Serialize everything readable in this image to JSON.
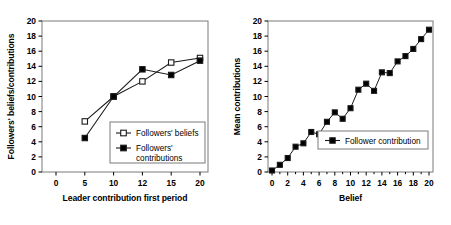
{
  "figure": {
    "background": "#ffffff",
    "line_color": "#1a1a1a",
    "marker_fill_open": "#ffffff",
    "marker_fill_filled": "#000000"
  },
  "chart_data": [
    {
      "type": "line",
      "panel": "left",
      "title": "",
      "xlabel": "Leader contribution first period",
      "ylabel": "Followers' beliefs/contributions",
      "xtick_labels": [
        "0",
        "5",
        "10",
        "12",
        "15",
        "20"
      ],
      "categories": [
        0,
        5,
        10,
        12,
        15,
        20
      ],
      "ytick_labels": [
        "0",
        "2",
        "4",
        "6",
        "8",
        "10",
        "12",
        "14",
        "16",
        "18",
        "20"
      ],
      "ylim": [
        0,
        20
      ],
      "grid": false,
      "legend_position": "lower-right-inside",
      "series": [
        {
          "name": "Followers' beliefs",
          "marker": "open-square",
          "x": [
            5,
            10,
            12,
            15,
            20
          ],
          "values": [
            6.7,
            10.0,
            12.0,
            14.5,
            15.1
          ]
        },
        {
          "name": "Followers' contributions",
          "marker": "filled-square",
          "x": [
            5,
            10,
            12,
            15,
            20
          ],
          "values": [
            4.5,
            10.0,
            13.6,
            12.85,
            14.75
          ]
        }
      ]
    },
    {
      "type": "line",
      "panel": "right",
      "title": "",
      "xlabel": "Belief",
      "ylabel": "Mean contributions",
      "xtick_labels": [
        "0",
        "2",
        "4",
        "6",
        "8",
        "10",
        "12",
        "14",
        "16",
        "18",
        "20"
      ],
      "ytick_labels": [
        "0",
        "2",
        "4",
        "6",
        "8",
        "10",
        "12",
        "14",
        "16",
        "18",
        "20"
      ],
      "xlim": [
        0,
        20
      ],
      "ylim": [
        0,
        20
      ],
      "grid": false,
      "legend_position": "lower-right-inside",
      "series": [
        {
          "name": "Follower contribution",
          "marker": "filled-square",
          "x": [
            0,
            1,
            2,
            3,
            4,
            5,
            6,
            7,
            8,
            9,
            10,
            11,
            12,
            13,
            14,
            15,
            16,
            17,
            18,
            19,
            20
          ],
          "values": [
            0.2,
            0.95,
            1.85,
            3.35,
            3.8,
            5.3,
            5.0,
            6.65,
            7.9,
            7.05,
            8.45,
            10.9,
            11.7,
            10.75,
            13.2,
            13.1,
            14.65,
            15.35,
            16.3,
            17.6,
            18.85
          ]
        }
      ]
    }
  ]
}
